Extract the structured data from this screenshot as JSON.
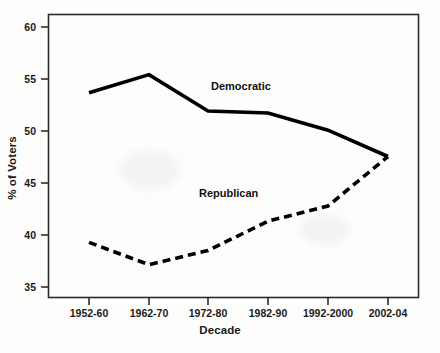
{
  "chart_data": {
    "type": "line",
    "title": "",
    "xlabel": "Decade",
    "ylabel": "% of Voters",
    "categories": [
      "1952-60",
      "1962-70",
      "1972-80",
      "1982-90",
      "1992-2000",
      "2002-04"
    ],
    "series": [
      {
        "name": "Democratic",
        "style": "solid",
        "color": "#000000",
        "values": [
          53.7,
          55.5,
          51.9,
          51.7,
          50.0,
          47.4
        ]
      },
      {
        "name": "Republican",
        "style": "dashed",
        "color": "#000000",
        "values": [
          38.9,
          36.7,
          38.1,
          41.0,
          42.5,
          47.4
        ]
      }
    ],
    "ylim": [
      33.5,
      61.5
    ],
    "yticks": [
      35,
      40,
      45,
      50,
      55,
      60
    ],
    "ytick_labels": [
      "35",
      "40",
      "45",
      "50",
      "55",
      "60"
    ],
    "grid": false,
    "legend_position": "inline-annotations",
    "annotations": [
      {
        "text": "Democratic",
        "x_px": 211,
        "y_px": 86
      },
      {
        "text": "Republican",
        "x_px": 199,
        "y_px": 193
      }
    ]
  },
  "axis": {
    "x_title": "Decade",
    "y_title": "% of Voters"
  },
  "series_labels": {
    "democratic": "Democratic",
    "republican": "Republican"
  },
  "ticks": {
    "y": [
      "60",
      "55",
      "50",
      "45",
      "40",
      "35"
    ],
    "x": [
      "1952-60",
      "1962-70",
      "1972-80",
      "1982-90",
      "1992-2000",
      "2002-04"
    ]
  },
  "colors": {
    "ink": "#000000",
    "background": "#fdfdfc",
    "frame": "#2b2b2b"
  }
}
